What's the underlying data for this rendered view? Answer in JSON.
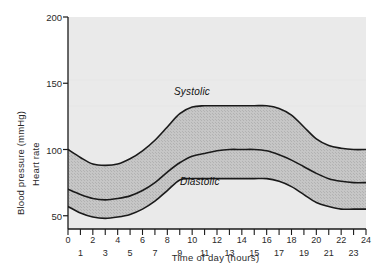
{
  "chart_data": {
    "type": "area",
    "title": "",
    "subtitle": "",
    "xlabel": "Time of day  (hours)",
    "ylabel_primary": "Blood pressure (mmHg)",
    "ylabel_secondary": "Heart rate",
    "xlim": [
      0,
      24
    ],
    "ylim": [
      40,
      200
    ],
    "yticks": [
      50,
      100,
      150,
      200
    ],
    "ytick_labels": [
      "50",
      "100",
      "150",
      "200"
    ],
    "xticks": [
      0,
      1,
      2,
      3,
      4,
      5,
      6,
      7,
      8,
      9,
      10,
      11,
      12,
      13,
      14,
      15,
      16,
      17,
      18,
      19,
      20,
      21,
      22,
      23,
      24
    ],
    "xtick_labels_even": [
      "0",
      "2",
      "4",
      "6",
      "8",
      "10",
      "12",
      "14",
      "16",
      "18",
      "20",
      "22",
      "24"
    ],
    "xtick_labels_odd": [
      "1",
      "3",
      "5",
      "7",
      "9",
      "11",
      "13",
      "15",
      "17",
      "19",
      "21",
      "23"
    ],
    "grid": false,
    "legend_position": "inline-annotations",
    "annotations": [
      {
        "text": "Systolic",
        "x": 11.0,
        "y": 143,
        "style": "italic"
      },
      {
        "text": "Diastolic",
        "x": 11.5,
        "y": 70,
        "style": "italic"
      }
    ],
    "band_fill_label": "Pulse pressure band (systolic minus diastolic)",
    "series": [
      {
        "name": "Systolic",
        "unit": "mmHg",
        "x": [
          0,
          1,
          2,
          3,
          4,
          5,
          6,
          7,
          8,
          9,
          10,
          11,
          12,
          13,
          14,
          15,
          16,
          17,
          18,
          19,
          20,
          21,
          22,
          23,
          24
        ],
        "values": [
          100,
          94,
          89,
          88,
          89,
          93,
          99,
          107,
          117,
          127,
          132,
          133,
          133,
          133,
          133,
          133,
          133,
          131,
          126,
          117,
          108,
          103,
          101,
          100,
          100
        ]
      },
      {
        "name": "Heart rate",
        "unit": "beats/min",
        "x": [
          0,
          1,
          2,
          3,
          4,
          5,
          6,
          7,
          8,
          9,
          10,
          11,
          12,
          13,
          14,
          15,
          16,
          17,
          18,
          19,
          20,
          21,
          22,
          23,
          24
        ],
        "values": [
          70,
          66,
          63,
          62,
          63,
          65,
          69,
          75,
          83,
          90,
          95,
          97,
          99,
          100,
          100,
          100,
          99,
          96,
          92,
          87,
          82,
          78,
          76,
          75,
          75
        ]
      },
      {
        "name": "Diastolic",
        "unit": "mmHg",
        "x": [
          0,
          1,
          2,
          3,
          4,
          5,
          6,
          7,
          8,
          9,
          10,
          11,
          12,
          13,
          14,
          15,
          16,
          17,
          18,
          19,
          20,
          21,
          22,
          23,
          24
        ],
        "values": [
          57,
          52,
          49,
          48,
          49,
          51,
          55,
          61,
          69,
          77,
          78,
          78,
          78,
          78,
          78,
          78,
          78,
          76,
          72,
          66,
          60,
          57,
          55,
          55,
          55
        ]
      }
    ],
    "colors": {
      "plot_background": "#eaeaea",
      "band_fill": "#c3c3c3",
      "curve_line": "#1a1a1a",
      "axis_line": "#1a1a1a",
      "text": "#2a2a2a"
    }
  },
  "axes": {
    "y_title_primary": "Blood pressure (mmHg)",
    "y_title_secondary": "Heart rate",
    "x_title": "Time of day  (hours)"
  },
  "annotations": {
    "systolic": "Systolic",
    "diastolic": "Diastolic"
  }
}
